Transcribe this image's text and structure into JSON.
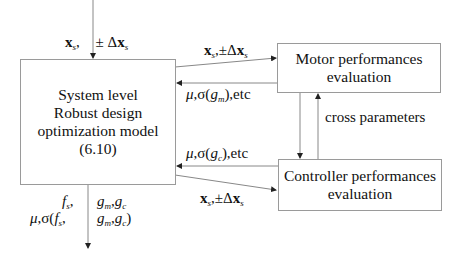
{
  "diagram": {
    "boxes": {
      "system": {
        "lines": [
          "System level",
          "Robust design",
          "optimization model",
          "(6.10)"
        ]
      },
      "motor": {
        "lines": [
          "Motor performances",
          "evaluation"
        ]
      },
      "controller": {
        "lines": [
          "Controller performances",
          "evaluation"
        ]
      }
    },
    "labels": {
      "input_top": {
        "x": "x",
        "x_sub": "s",
        "sep": ",",
        "pm": "± Δ",
        "dx": "x",
        "dx_sub": "s"
      },
      "to_motor": {
        "x": "x",
        "x_sub": "s",
        "sep": ",",
        "pm": "±Δ",
        "dx": "x",
        "dx_sub": "s"
      },
      "from_motor": {
        "mu": "μ",
        "sigma": ",σ(",
        "g": "g",
        "g_sub": "m",
        "tail": "),etc"
      },
      "cross": "cross parameters",
      "from_controller": {
        "mu": "μ",
        "sigma": ",σ(",
        "g": "g",
        "g_sub": "c",
        "tail": "),etc"
      },
      "to_controller": {
        "x": "x",
        "x_sub": "s",
        "sep": ",",
        "pm": "±Δ",
        "dx": "x",
        "dx_sub": "s"
      },
      "output_left_1": {
        "f": "f",
        "f_sub": "s",
        "sep": ","
      },
      "output_left_2": {
        "mu": "μ",
        "sigma": ",σ(",
        "f": "f",
        "f_sub": "s",
        "sep": ","
      },
      "output_right_1": {
        "gm": "g",
        "gm_sub": "m",
        "sep": ",",
        "gc": "g",
        "gc_sub": "c"
      },
      "output_right_2": {
        "gm": "g",
        "gm_sub": "m",
        "sep": ",",
        "gc": "g",
        "gc_sub": "c",
        "tail": ")"
      }
    },
    "colors": {
      "line": "#777777",
      "border": "#9a9a9a",
      "text": "#111111"
    }
  }
}
